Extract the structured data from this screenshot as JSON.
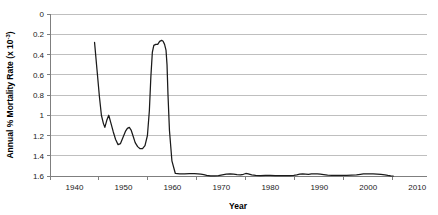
{
  "chart_data": {
    "type": "line",
    "title": "",
    "xlabel": "Year",
    "ylabel": "Annual % Mortality Rate (x 10",
    "ylabel_sup": "-3",
    "ylabel_sup_close": ")",
    "ylabel_full": "Annual % Mortality Rate (x 10^-3)",
    "y_inverted": true,
    "grid": true,
    "legend": "none",
    "xlim": [
      1935,
      2012
    ],
    "ylim": [
      0,
      1.6
    ],
    "x_ticks": [
      1940,
      1950,
      1960,
      1970,
      1980,
      1990,
      2000,
      2010
    ],
    "x_tick_labels": [
      "1940",
      "1950",
      "1960",
      "1970",
      "1980",
      "1990",
      "2000",
      "2010"
    ],
    "y_ticks": [
      0,
      0.2,
      0.4,
      0.6,
      0.8,
      1,
      1.2,
      1.4,
      1.6
    ],
    "y_tick_labels": [
      "0",
      "0.2",
      "0.4",
      "0.6",
      "0.8",
      "1",
      "1.2",
      "1.4",
      "1.6"
    ],
    "line_color": "#1a1a1a",
    "grid_color": "#bfbfbf",
    "axis_color": "#7f7f7f",
    "series": [
      {
        "name": "mortality",
        "x": [
          1944.1,
          1944.6,
          1945.1,
          1945.5,
          1945.9,
          1946.2,
          1946.6,
          1947.0,
          1947.4,
          1947.9,
          1948.4,
          1948.9,
          1949.4,
          1949.9,
          1950.4,
          1950.8,
          1951.2,
          1951.6,
          1952.0,
          1952.4,
          1952.9,
          1953.4,
          1953.9,
          1954.4,
          1954.9,
          1955.3,
          1955.6,
          1955.9,
          1956.2,
          1956.6,
          1957.0,
          1957.4,
          1957.8,
          1958.1,
          1958.4,
          1958.7,
          1958.9,
          1959.1,
          1959.4,
          1959.9,
          1960.6,
          1961.5,
          1962.5,
          1963.5,
          1964.5,
          1965.2,
          1965.8,
          1966.4,
          1967.0,
          1967.8,
          1968.6,
          1969.4,
          1970.2,
          1971.0,
          1971.8,
          1972.5,
          1973.2,
          1973.9,
          1974.5,
          1975.0,
          1975.5,
          1976.2,
          1977.0,
          1978.0,
          1979.0,
          1980.0,
          1981.0,
          1982.0,
          1983.0,
          1984.0,
          1984.8,
          1985.4,
          1986.0,
          1986.6,
          1987.2,
          1987.8,
          1988.4,
          1989.0,
          1989.6,
          1990.2,
          1990.9,
          1991.7,
          1992.6,
          1993.6,
          1994.6,
          1995.6,
          1996.6,
          1997.6,
          1998.4,
          1999.0,
          1999.6,
          2000.3,
          2001.0,
          2001.8,
          2002.6,
          2003.4,
          2004.0,
          2004.6,
          2005.1
        ],
        "y": [
          0.28,
          0.55,
          0.82,
          1.0,
          1.08,
          1.12,
          1.05,
          1.0,
          1.07,
          1.16,
          1.24,
          1.29,
          1.28,
          1.22,
          1.16,
          1.13,
          1.12,
          1.15,
          1.21,
          1.27,
          1.31,
          1.33,
          1.33,
          1.3,
          1.2,
          0.95,
          0.62,
          0.38,
          0.31,
          0.3,
          0.3,
          0.27,
          0.26,
          0.27,
          0.3,
          0.36,
          0.5,
          0.8,
          1.15,
          1.45,
          1.575,
          1.578,
          1.578,
          1.577,
          1.576,
          1.578,
          1.581,
          1.586,
          1.594,
          1.598,
          1.599,
          1.596,
          1.588,
          1.582,
          1.58,
          1.582,
          1.586,
          1.589,
          1.583,
          1.575,
          1.579,
          1.588,
          1.594,
          1.596,
          1.595,
          1.595,
          1.596,
          1.596,
          1.596,
          1.596,
          1.594,
          1.589,
          1.582,
          1.579,
          1.581,
          1.583,
          1.58,
          1.578,
          1.578,
          1.581,
          1.586,
          1.591,
          1.594,
          1.595,
          1.595,
          1.594,
          1.592,
          1.589,
          1.584,
          1.58,
          1.578,
          1.578,
          1.579,
          1.581,
          1.584,
          1.589,
          1.594,
          1.598,
          1.6
        ]
      }
    ]
  },
  "plot_geometry": {
    "left": 50,
    "right": 427,
    "top": 14,
    "bottom": 176
  }
}
